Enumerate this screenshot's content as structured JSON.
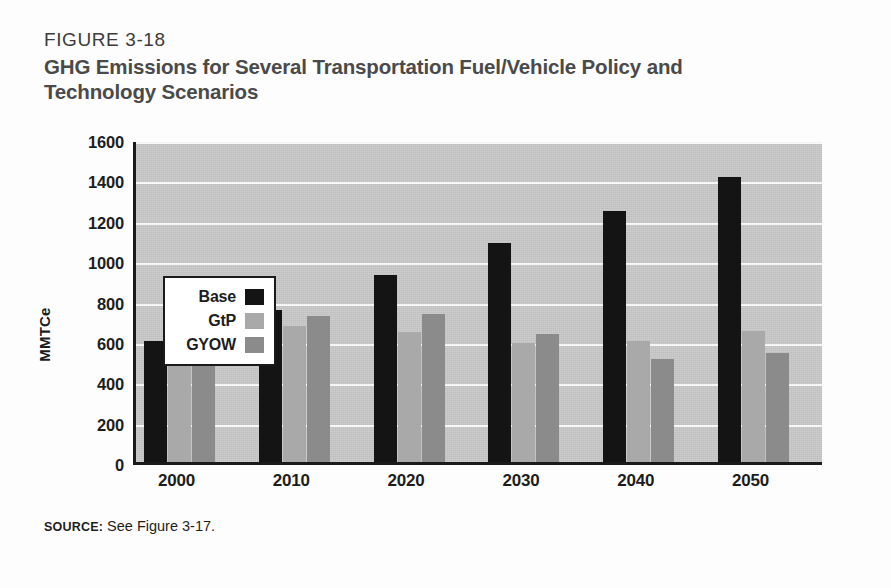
{
  "figure": {
    "number": "FIGURE 3-18",
    "title": "GHG Emissions for Several Transportation Fuel/Vehicle Policy and Technology Scenarios",
    "source_label": "SOURCE:",
    "source_text": " See Figure 3-17."
  },
  "colors": {
    "base": "#141414",
    "gtp": "#a9a9a9",
    "gyow": "#8b8b8b",
    "plot_background": "#c9c9c9",
    "gridline": "#fdfdfd",
    "axis": "#1a1a1a",
    "title": "#4a4a4a"
  },
  "chart_data": {
    "type": "bar",
    "title": "GHG Emissions for Several Transportation Fuel/Vehicle Policy and Technology Scenarios",
    "xlabel": "",
    "ylabel": "MMTCe",
    "categories": [
      "2000",
      "2010",
      "2020",
      "2030",
      "2040",
      "2050"
    ],
    "series": [
      {
        "name": "Base",
        "color": "#141414",
        "values": [
          600,
          755,
          925,
          1085,
          1245,
          1410
        ]
      },
      {
        "name": "GtP",
        "color": "#a9a9a9",
        "values": [
          600,
          675,
          645,
          590,
          600,
          650
        ]
      },
      {
        "name": "GYOW",
        "color": "#8b8b8b",
        "values": [
          600,
          725,
          735,
          635,
          510,
          540
        ]
      }
    ],
    "ylim": [
      0,
      1600
    ],
    "ytick_values": [
      0,
      200,
      400,
      600,
      800,
      1000,
      1200,
      1400,
      1600
    ],
    "ytick_labels": [
      "0",
      "200",
      "400",
      "600",
      "800",
      "1000",
      "1200",
      "1400",
      "1600"
    ],
    "grid": true,
    "grid_axis": "y",
    "legend_position": "upper-left-inside",
    "legend_entries": [
      "Base",
      "GtP",
      "GYOW"
    ]
  }
}
